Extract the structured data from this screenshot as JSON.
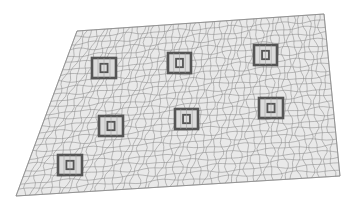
{
  "figure": {
    "background": "#ffffff",
    "mesh_line_color": "#8a8a8a",
    "mesh_fill": "#e9e9e9",
    "feature_color": "#555555",
    "plate_corners": {
      "top_left": [
        77,
        31
      ],
      "top_right": [
        324,
        14
      ],
      "bottom_right": [
        340,
        176
      ],
      "bottom_left": [
        16,
        196
      ]
    },
    "grid": {
      "cols": 48,
      "rows": 26
    },
    "features": [
      {
        "id": 1,
        "x": 92,
        "y": 58,
        "w": 24,
        "h": 20
      },
      {
        "id": 2,
        "x": 168,
        "y": 53,
        "w": 23,
        "h": 20
      },
      {
        "id": 3,
        "x": 254,
        "y": 45,
        "w": 23,
        "h": 20
      },
      {
        "id": 4,
        "x": 99,
        "y": 116,
        "w": 24,
        "h": 20
      },
      {
        "id": 5,
        "x": 175,
        "y": 109,
        "w": 23,
        "h": 20
      },
      {
        "id": 6,
        "x": 259,
        "y": 98,
        "w": 24,
        "h": 20
      },
      {
        "id": 7,
        "x": 58,
        "y": 155,
        "w": 24,
        "h": 20
      }
    ]
  }
}
